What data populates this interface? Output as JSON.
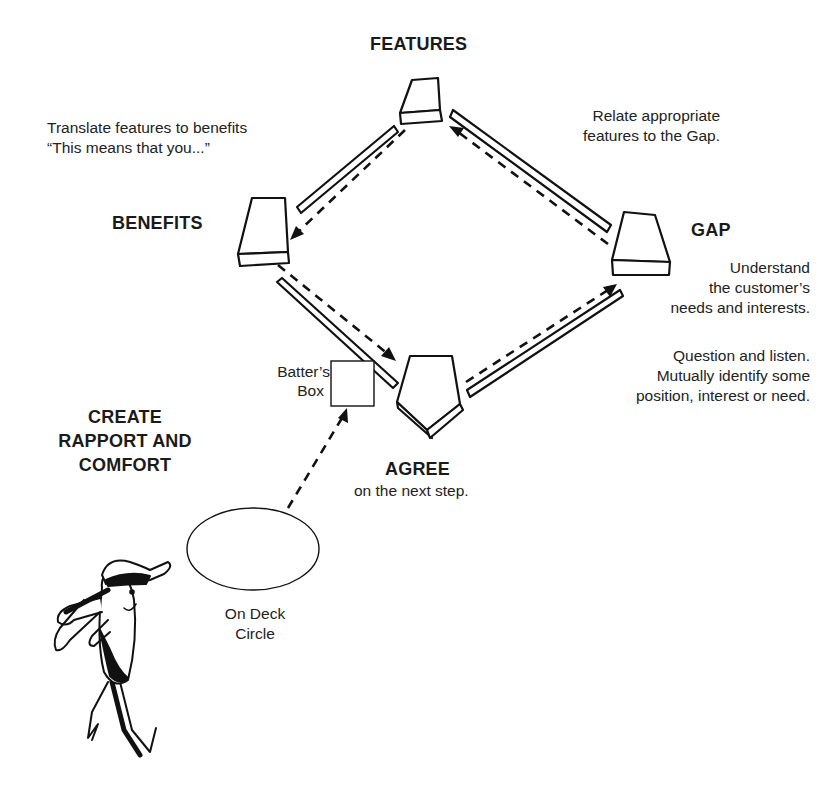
{
  "bases": {
    "features": {
      "title": "FEATURES"
    },
    "benefits": {
      "title": "BENEFITS",
      "note": [
        "Translate features to benefits",
        "“This means that you...”"
      ]
    },
    "gap": {
      "title": "GAP",
      "note": [
        "Understand",
        "the customer’s",
        "needs and interests."
      ]
    },
    "agree": {
      "title": "AGREE",
      "note": [
        "on the next step."
      ]
    }
  },
  "path_notes": {
    "gap_to_features": [
      "Relate appropriate",
      "features to the Gap."
    ],
    "agree_to_gap": [
      "Question and listen.",
      "Mutually identify some",
      "position, interest or need."
    ]
  },
  "batters_box": {
    "label": [
      "Batter’s",
      "Box"
    ]
  },
  "on_deck_circle": {
    "label": [
      "On Deck",
      "Circle"
    ]
  },
  "start": {
    "title": [
      "CREATE",
      "RAPPORT AND",
      "COMFORT"
    ]
  },
  "icons": {
    "player": "baseball-batter-cartoon",
    "base": "home-plate-base"
  }
}
